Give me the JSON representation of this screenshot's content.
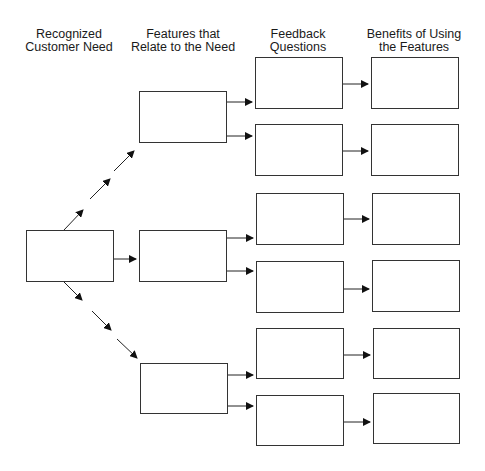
{
  "headers": [
    {
      "line1": "Recognized",
      "line2": "Customer Need"
    },
    {
      "line1": "Features that",
      "line2": "Relate to the Need"
    },
    {
      "line1": "Feedback",
      "line2": "Questions"
    },
    {
      "line1": "Benefits of Using",
      "line2": "the Features"
    }
  ],
  "colors": {
    "line": "#222222",
    "box_border": "#333333",
    "background": "#ffffff"
  }
}
